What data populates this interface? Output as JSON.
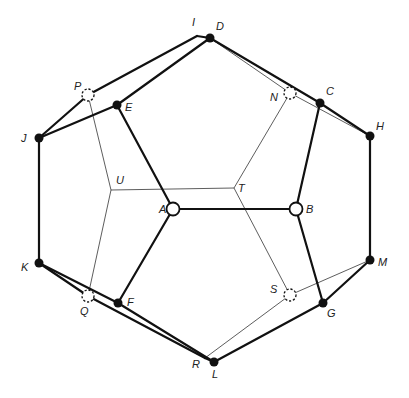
{
  "colors": {
    "edge": "#111111",
    "thin_edge": "#333333",
    "filled_vertex": "#111111",
    "open_vertex_fill": "#ffffff",
    "background": "#ffffff"
  },
  "vertices": [
    {
      "id": "A",
      "x": 173,
      "y": 209,
      "style": "open",
      "label_dx": -14,
      "label_dy": 4
    },
    {
      "id": "B",
      "x": 296,
      "y": 209,
      "style": "open",
      "label_dx": 10,
      "label_dy": 4
    },
    {
      "id": "C",
      "x": 320,
      "y": 103,
      "style": "filled",
      "label_dx": 6,
      "label_dy": -8
    },
    {
      "id": "D",
      "x": 210,
      "y": 38,
      "style": "filled",
      "label_dx": 6,
      "label_dy": -8
    },
    {
      "id": "E",
      "x": 117,
      "y": 105,
      "style": "filled",
      "label_dx": 8,
      "label_dy": 6
    },
    {
      "id": "F",
      "x": 118,
      "y": 303,
      "style": "filled",
      "label_dx": 9,
      "label_dy": 3
    },
    {
      "id": "G",
      "x": 323,
      "y": 303,
      "style": "filled",
      "label_dx": 4,
      "label_dy": 14
    },
    {
      "id": "H",
      "x": 370,
      "y": 136,
      "style": "filled",
      "label_dx": 6,
      "label_dy": -6
    },
    {
      "id": "I",
      "x": 197,
      "y": 36,
      "style": "junction",
      "label_dx": -5,
      "label_dy": -10
    },
    {
      "id": "J",
      "x": 39,
      "y": 138,
      "style": "filled",
      "label_dx": -18,
      "label_dy": 4
    },
    {
      "id": "K",
      "x": 39,
      "y": 263,
      "style": "filled",
      "label_dx": -18,
      "label_dy": 8
    },
    {
      "id": "L",
      "x": 214,
      "y": 362,
      "style": "filled",
      "label_dx": -2,
      "label_dy": 16
    },
    {
      "id": "M",
      "x": 370,
      "y": 260,
      "style": "filled",
      "label_dx": 8,
      "label_dy": 6
    },
    {
      "id": "N",
      "x": 290,
      "y": 93,
      "style": "hidden",
      "label_dx": -20,
      "label_dy": 8
    },
    {
      "id": "P",
      "x": 88,
      "y": 95,
      "style": "hidden",
      "label_dx": -14,
      "label_dy": -5
    },
    {
      "id": "Q",
      "x": 88,
      "y": 296,
      "style": "hidden",
      "label_dx": -8,
      "label_dy": 19
    },
    {
      "id": "R",
      "x": 205,
      "y": 358,
      "style": "junction",
      "label_dx": -13,
      "label_dy": 10
    },
    {
      "id": "S",
      "x": 290,
      "y": 295,
      "style": "hidden",
      "label_dx": -20,
      "label_dy": -2
    },
    {
      "id": "T",
      "x": 234,
      "y": 188,
      "style": "junction",
      "label_dx": 4,
      "label_dy": 4
    },
    {
      "id": "U",
      "x": 111,
      "y": 190,
      "style": "junction",
      "label_dx": 5,
      "label_dy": -6
    }
  ],
  "thick_edges": [
    [
      "A",
      "B"
    ],
    [
      "A",
      "E"
    ],
    [
      "A",
      "F"
    ],
    [
      "B",
      "C"
    ],
    [
      "B",
      "G"
    ],
    [
      "E",
      "J"
    ],
    [
      "E",
      "D"
    ],
    [
      "J",
      "P"
    ],
    [
      "P",
      "I"
    ],
    [
      "I",
      "D"
    ],
    [
      "D",
      "C"
    ],
    [
      "C",
      "H"
    ],
    [
      "H",
      "M"
    ],
    [
      "M",
      "G"
    ],
    [
      "G",
      "L"
    ],
    [
      "L",
      "R"
    ],
    [
      "R",
      "Q"
    ],
    [
      "Q",
      "K"
    ],
    [
      "K",
      "J"
    ],
    [
      "K",
      "F"
    ],
    [
      "F",
      "L"
    ]
  ],
  "thin_edges": [
    [
      "P",
      "U"
    ],
    [
      "U",
      "Q"
    ],
    [
      "U",
      "T"
    ],
    [
      "T",
      "N"
    ],
    [
      "T",
      "S"
    ],
    [
      "N",
      "H"
    ],
    [
      "D",
      "N"
    ],
    [
      "S",
      "M"
    ],
    [
      "S",
      "R"
    ]
  ]
}
